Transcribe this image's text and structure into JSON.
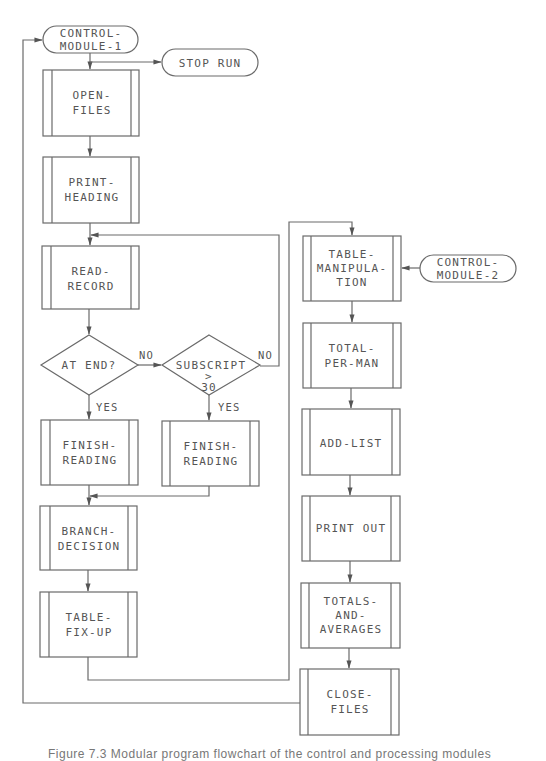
{
  "diagram": {
    "type": "flowchart",
    "colors": {
      "line": "#6a6a6a",
      "text": "#555555",
      "background": "#ffffff"
    },
    "terminals": [
      {
        "id": "cm1",
        "lines": [
          "CONTROL-",
          "MODULE-1"
        ]
      },
      {
        "id": "stop",
        "lines": [
          "STOP RUN"
        ]
      },
      {
        "id": "cm2",
        "lines": [
          "CONTROL-",
          "MODULE-2"
        ]
      }
    ],
    "modules": [
      {
        "id": "open_files",
        "lines": [
          "OPEN-",
          "FILES"
        ]
      },
      {
        "id": "print_heading",
        "lines": [
          "PRINT-",
          "HEADING"
        ]
      },
      {
        "id": "read_record",
        "lines": [
          "READ-",
          "RECORD"
        ]
      },
      {
        "id": "finish_reading_1",
        "lines": [
          "FINISH-",
          "READING"
        ]
      },
      {
        "id": "finish_reading_2",
        "lines": [
          "FINISH-",
          "READING"
        ]
      },
      {
        "id": "branch_decision",
        "lines": [
          "BRANCH-",
          "DECISION"
        ]
      },
      {
        "id": "table_fix_up",
        "lines": [
          "TABLE-",
          "FIX-UP"
        ]
      },
      {
        "id": "table_manipulation",
        "lines": [
          "TABLE-",
          "MANIPULA-",
          "TION"
        ]
      },
      {
        "id": "total_per_man",
        "lines": [
          "TOTAL-",
          "PER-MAN"
        ]
      },
      {
        "id": "add_list",
        "lines": [
          "ADD-LIST"
        ]
      },
      {
        "id": "print_out",
        "lines": [
          "PRINT OUT"
        ]
      },
      {
        "id": "totals_averages",
        "lines": [
          "TOTALS-",
          "AND-",
          "AVERAGES"
        ]
      },
      {
        "id": "close_files",
        "lines": [
          "CLOSE-",
          "FILES"
        ]
      }
    ],
    "decisions": [
      {
        "id": "at_end",
        "lines": [
          "AT END?"
        ]
      },
      {
        "id": "subscript",
        "lines": [
          "SUBSCRIPT",
          ">",
          "30"
        ]
      }
    ],
    "labels": {
      "at_end_no": "NO",
      "at_end_yes": "YES",
      "subscript_no": "NO",
      "subscript_yes": "YES"
    }
  },
  "caption": "Figure 7.3  Modular program flowchart of the control and processing modules"
}
